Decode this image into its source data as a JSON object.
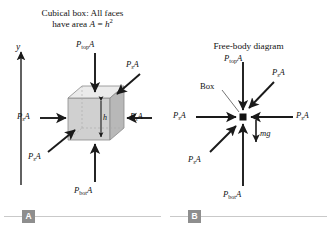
{
  "figure": {
    "background_color": "#ffffff",
    "ink_color": "#111111",
    "cube_fill": "#d9d9d9",
    "cube_fill_top": "#ebebeb",
    "cube_fill_side": "#bdbdbd",
    "tag_color": "#8e8e8e",
    "rule_color": "#c9c9c9"
  },
  "panel_a": {
    "tag": "A",
    "caption_line1": "Cubical box: All faces",
    "caption_line2_pre": "have area ",
    "caption_var_a": "A",
    "caption_eq": " = ",
    "caption_var_h": "h",
    "caption_exp": "2",
    "axis_label": "y",
    "height_label": "h",
    "labels": {
      "top": {
        "p": "P",
        "sub": "top",
        "a": "A"
      },
      "bottom": {
        "p": "P",
        "sub": "bot",
        "a": "A"
      },
      "left": {
        "p": "P",
        "sub": "s",
        "a": "A"
      },
      "right": {
        "p": "P",
        "sub": "s",
        "a": "A"
      },
      "front_upper_right": {
        "p": "P",
        "sub": "s",
        "a": "A"
      },
      "front_lower_left": {
        "p": "P",
        "sub": "s",
        "a": "A"
      }
    }
  },
  "panel_b": {
    "tag": "B",
    "caption": "Free-body diagram",
    "box_label": "Box",
    "weight_label": "mg",
    "labels": {
      "top": {
        "p": "P",
        "sub": "top",
        "a": "A"
      },
      "bottom": {
        "p": "P",
        "sub": "bot",
        "a": "A"
      },
      "left": {
        "p": "P",
        "sub": "s",
        "a": "A"
      },
      "right": {
        "p": "P",
        "sub": "s",
        "a": "A"
      },
      "upper_right": {
        "p": "P",
        "sub": "s",
        "a": "A"
      },
      "lower_left": {
        "p": "P",
        "sub": "s",
        "a": "A"
      }
    }
  }
}
